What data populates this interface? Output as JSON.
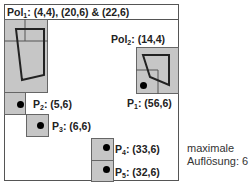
{
  "title": {
    "prefix": "Pol",
    "sub": "1",
    "coords": ": (4,4), (20,6) & (22,6)"
  },
  "pol2": {
    "prefix": "Pol",
    "sub": "2",
    "coords": ": (14,4)"
  },
  "points": [
    {
      "prefix": "P",
      "sub": "1",
      "coords": ": (56,6)"
    },
    {
      "prefix": "P",
      "sub": "2",
      "coords": ": (5,6)"
    },
    {
      "prefix": "P",
      "sub": "3",
      "coords": ": (6,6)"
    },
    {
      "prefix": "P",
      "sub": "4",
      "coords": ": (33,6)"
    },
    {
      "prefix": "P",
      "sub": "5",
      "coords": ": (32,6)"
    }
  ],
  "side_note": {
    "line1": "maximale",
    "line2": "Auflösung: 6"
  },
  "colors": {
    "cell_fill": "#c6c6c6",
    "line": "#222222",
    "frame": "#555555"
  }
}
